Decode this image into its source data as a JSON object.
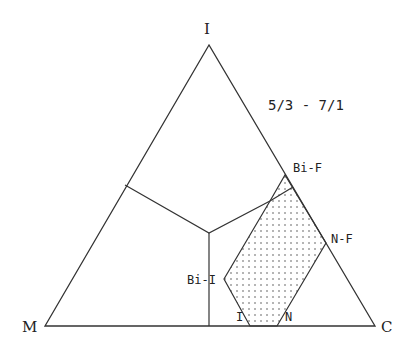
{
  "diagram": {
    "title": "5/3 - 7/1",
    "vertices": {
      "top": "I",
      "left": "M",
      "right": "C"
    },
    "region_labels": {
      "bi_f": "Bi-F",
      "n_f": "N-F",
      "bi_i": "Bi-I",
      "i": "I",
      "n": "N"
    },
    "colors": {
      "line": "#333333",
      "dot": "#555555",
      "background": "#ffffff"
    }
  }
}
